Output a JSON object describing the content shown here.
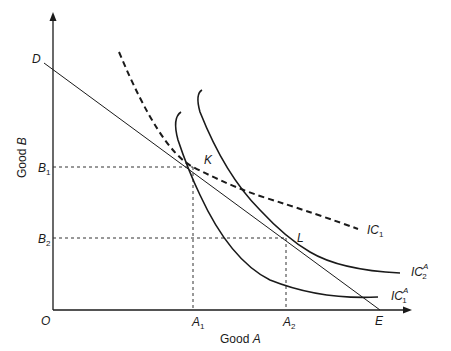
{
  "diagram": {
    "type": "indifference-curve-diagram",
    "axes": {
      "x_label_prefix": "Good ",
      "x_label_var": "A",
      "y_label_prefix": "Good ",
      "y_label_var": "B",
      "origin": "O"
    },
    "points": {
      "D": "D",
      "E": "E",
      "K": "K",
      "L": "L"
    },
    "ticks": {
      "A1": {
        "base": "A",
        "sub": "1"
      },
      "A2": {
        "base": "A",
        "sub": "2"
      },
      "B1": {
        "base": "B",
        "sub": "1"
      },
      "B2": {
        "base": "B",
        "sub": "2"
      }
    },
    "curves": {
      "IC1": {
        "base": "IC",
        "sub": "1",
        "style": "dashed"
      },
      "IC1A": {
        "base": "IC",
        "sub": "1",
        "sup": "A",
        "style": "solid"
      },
      "IC2A": {
        "base": "IC",
        "sub": "2",
        "sup": "A",
        "style": "solid"
      },
      "budget_line": {
        "from": "D",
        "to": "E",
        "style": "thin solid"
      }
    },
    "colors": {
      "ink": "#1a1a1a",
      "background": "#ffffff"
    }
  }
}
